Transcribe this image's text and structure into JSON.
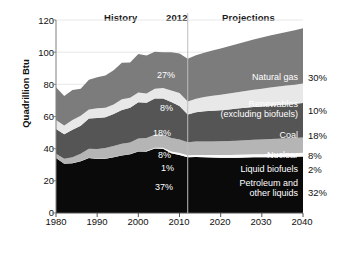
{
  "header": {
    "history_label": "History",
    "year_divider_label": "2012",
    "projections_label": "Projections"
  },
  "axes": {
    "ylabel": "Quadrillion Btu",
    "yticks": [
      "0",
      "20",
      "40",
      "60",
      "80",
      "100",
      "120"
    ],
    "xticks": [
      "1980",
      "1990",
      "2000",
      "2010",
      "2020",
      "2030",
      "2040"
    ]
  },
  "chart_data": {
    "type": "area",
    "title": "",
    "subtitle": "",
    "xlabel": "",
    "ylabel": "Quadrillion Btu",
    "xlim": [
      1980,
      2040
    ],
    "ylim": [
      0,
      120
    ],
    "ytick_values": [
      0,
      20,
      40,
      60,
      80,
      100,
      120
    ],
    "xtick_values": [
      1980,
      1990,
      2000,
      2010,
      2020,
      2030,
      2040
    ],
    "grid": true,
    "legend": "inline-right",
    "stacked": true,
    "divider_year": 2012,
    "annotations": [
      "History",
      "2012",
      "Projections"
    ],
    "x": [
      1980,
      1982,
      1984,
      1986,
      1988,
      1990,
      1992,
      1994,
      1996,
      1998,
      2000,
      2002,
      2004,
      2006,
      2008,
      2010,
      2012,
      2014,
      2016,
      2018,
      2020,
      2022,
      2024,
      2026,
      2028,
      2030,
      2032,
      2034,
      2036,
      2038,
      2040
    ],
    "series": [
      {
        "name": "Petroleum and other liquids",
        "color": "#0a0a0a",
        "label_2012": "37%",
        "label_2040": "32%",
        "values": [
          34.2,
          30.6,
          31.0,
          32.2,
          34.2,
          33.6,
          33.8,
          34.7,
          35.7,
          36.6,
          38.2,
          38.2,
          40.1,
          40.0,
          37.2,
          36.0,
          34.7,
          34.8,
          34.6,
          34.5,
          34.4,
          34.4,
          34.4,
          34.5,
          34.6,
          34.6,
          34.7,
          34.8,
          34.9,
          35.0,
          35.1
        ]
      },
      {
        "name": "Liquid biofuels",
        "color": "#fbfbfb",
        "label_2012": "1%",
        "label_2040": "2%",
        "values": [
          0.0,
          0.0,
          0.1,
          0.1,
          0.1,
          0.1,
          0.1,
          0.1,
          0.1,
          0.1,
          0.2,
          0.3,
          0.4,
          0.6,
          1.0,
          1.3,
          1.2,
          1.3,
          1.4,
          1.5,
          1.6,
          1.7,
          1.8,
          1.9,
          2.0,
          2.0,
          2.1,
          2.1,
          2.2,
          2.2,
          2.3
        ]
      },
      {
        "name": "Nuclear",
        "color": "#b5b5b5",
        "label_2012": "8%",
        "label_2040": "8%",
        "values": [
          2.7,
          3.1,
          3.6,
          4.5,
          5.6,
          6.1,
          6.5,
          6.8,
          7.2,
          7.2,
          7.9,
          8.1,
          8.2,
          8.2,
          8.4,
          8.4,
          8.1,
          8.3,
          8.4,
          8.5,
          8.6,
          8.7,
          8.8,
          8.9,
          9.0,
          9.1,
          9.2,
          9.3,
          9.3,
          9.4,
          9.5
        ]
      },
      {
        "name": "Coal",
        "color": "#555555",
        "label_2012": "18%",
        "label_2040": "18%",
        "values": [
          15.4,
          15.3,
          17.1,
          17.5,
          18.8,
          19.2,
          19.1,
          19.9,
          21.0,
          21.6,
          22.6,
          21.9,
          22.5,
          22.4,
          22.4,
          20.8,
          17.3,
          18.2,
          18.8,
          19.1,
          19.3,
          19.6,
          19.9,
          20.1,
          20.3,
          20.5,
          20.7,
          20.9,
          21.1,
          21.3,
          21.5
        ]
      },
      {
        "name": "Renewables (excluding biofuels)",
        "color": "#e8e8e8",
        "label_2012": "8%",
        "label_2040": "10%",
        "values": [
          5.5,
          5.4,
          6.1,
          6.2,
          5.6,
          6.1,
          5.9,
          6.0,
          6.8,
          6.2,
          6.1,
          5.8,
          6.1,
          6.5,
          7.2,
          8.1,
          8.0,
          8.4,
          8.9,
          9.3,
          9.6,
          9.9,
          10.2,
          10.5,
          10.8,
          11.1,
          11.3,
          11.5,
          11.7,
          11.9,
          12.1
        ]
      },
      {
        "name": "Natural gas",
        "color": "#7c7c7c",
        "label_2012": "27%",
        "label_2040": "30%",
        "values": [
          20.4,
          18.4,
          18.5,
          16.7,
          18.6,
          19.3,
          20.1,
          21.2,
          22.6,
          21.9,
          23.8,
          23.6,
          22.9,
          22.2,
          23.8,
          24.6,
          26.6,
          27.1,
          27.6,
          28.2,
          28.8,
          29.4,
          30.0,
          30.6,
          31.2,
          31.8,
          32.3,
          32.8,
          33.3,
          33.8,
          34.4
        ]
      }
    ]
  }
}
